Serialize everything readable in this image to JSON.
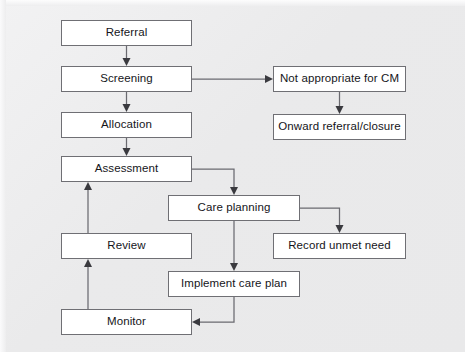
{
  "diagram": {
    "background_color": "#ececed",
    "box_fill": "#ffffff",
    "box_border_color": "#6f6f74",
    "connector_color": "#6a6a70",
    "nodes": [
      {
        "id": "referral",
        "label": "Referral",
        "x": 61,
        "y": 20,
        "w": 131,
        "h": 26
      },
      {
        "id": "screening",
        "label": "Screening",
        "x": 61,
        "y": 66,
        "w": 131,
        "h": 26
      },
      {
        "id": "allocation",
        "label": "Allocation",
        "x": 61,
        "y": 112,
        "w": 131,
        "h": 26
      },
      {
        "id": "assessment",
        "label": "Assessment",
        "x": 61,
        "y": 156,
        "w": 131,
        "h": 26
      },
      {
        "id": "review",
        "label": "Review",
        "x": 61,
        "y": 233,
        "w": 131,
        "h": 26
      },
      {
        "id": "monitor",
        "label": "Monitor",
        "x": 61,
        "y": 309,
        "w": 131,
        "h": 26
      },
      {
        "id": "care-planning",
        "label": "Care planning",
        "x": 168,
        "y": 195,
        "w": 132,
        "h": 26
      },
      {
        "id": "implement-care-plan",
        "label": "Implement care plan",
        "x": 168,
        "y": 271,
        "w": 132,
        "h": 26
      },
      {
        "id": "not-appropriate",
        "label": "Not appropriate for CM",
        "x": 273,
        "y": 66,
        "w": 133,
        "h": 26
      },
      {
        "id": "onward-referral",
        "label": "Onward referral/closure",
        "x": 273,
        "y": 114,
        "w": 133,
        "h": 26
      },
      {
        "id": "record-unmet-need",
        "label": "Record unmet need",
        "x": 273,
        "y": 233,
        "w": 133,
        "h": 26
      }
    ],
    "edges": [
      {
        "id": "referral-to-screening",
        "from": "referral",
        "to": "screening",
        "path": "M126.5,46 L126.5,62",
        "head": "126.5,66 122.5,58 130.5,58"
      },
      {
        "id": "screening-to-allocation",
        "from": "screening",
        "to": "allocation",
        "path": "M126.5,92 L126.5,108",
        "head": "126.5,112 122.5,104 130.5,104"
      },
      {
        "id": "allocation-to-assessment",
        "from": "allocation",
        "to": "assessment",
        "path": "M126.5,138 L126.5,152",
        "head": "126.5,156 122.5,148 130.5,148"
      },
      {
        "id": "screening-to-not-appropriate",
        "from": "screening",
        "to": "not-appropriate",
        "path": "M192,79 L269,79",
        "head": "273,79 265,75 265,83"
      },
      {
        "id": "not-appropriate-to-onward",
        "from": "not-appropriate",
        "to": "onward-referral",
        "path": "M339.5,92 L339.5,110",
        "head": "339.5,114 335.5,106 343.5,106"
      },
      {
        "id": "assessment-to-care-planning",
        "from": "assessment",
        "to": "care-planning",
        "path": "M192,169 L234,169 L234,191",
        "head": "234,195 230,187 238,187"
      },
      {
        "id": "care-planning-to-record",
        "from": "care-planning",
        "to": "record-unmet-need",
        "path": "M300,208 L339.5,208 L339.5,229",
        "head": "339.5,233 335.5,225 343.5,225"
      },
      {
        "id": "care-planning-to-implement",
        "from": "care-planning",
        "to": "implement-care-plan",
        "path": "M234,221 L234,267",
        "head": "234,271 230,263 238,263"
      },
      {
        "id": "implement-to-monitor",
        "from": "implement-care-plan",
        "to": "monitor",
        "path": "M234,297 L234,322 L196,322",
        "head": "192,322 200,318 200,326"
      },
      {
        "id": "monitor-to-review",
        "from": "monitor",
        "to": "review",
        "path": "M88,309 L88,263",
        "head": "88,259 84,267 92,267"
      },
      {
        "id": "review-to-assessment",
        "from": "review",
        "to": "assessment",
        "path": "M88,233 L88,186",
        "head": "88,182 84,190 92,190"
      }
    ]
  }
}
